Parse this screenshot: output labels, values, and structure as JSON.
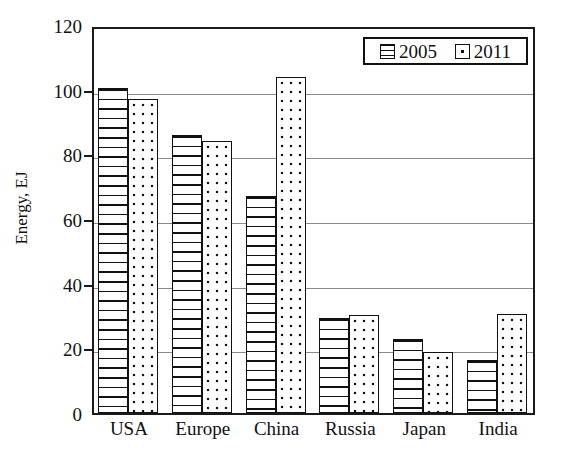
{
  "chart_data": {
    "type": "bar",
    "title": "",
    "xlabel": "",
    "ylabel": "Energy, EJ",
    "categories": [
      "USA",
      "Europe",
      "China",
      "Russia",
      "Japan",
      "India"
    ],
    "series": [
      {
        "name": "2005",
        "values": [
          100.5,
          86.0,
          67.0,
          29.5,
          23.0,
          16.5
        ],
        "pattern": "horizontal-lines"
      },
      {
        "name": "2011",
        "values": [
          97.0,
          84.0,
          104.0,
          30.3,
          19.0,
          30.5
        ],
        "pattern": "dots"
      }
    ],
    "ylim": [
      0,
      120
    ],
    "yticks": [
      0,
      20,
      40,
      60,
      80,
      100,
      120
    ],
    "ytick_labels": [
      "0",
      "20",
      "40",
      "60",
      "80",
      "100",
      "120"
    ],
    "gridlines": true,
    "grid_axis": "y",
    "legend_position": "top-right",
    "legend_entries": [
      "2005",
      "2011"
    ],
    "colors": {
      "axis": "#111111",
      "grid": "#8a8a8a",
      "bar_fill": "#ffffff",
      "bar_edge": "#111111",
      "background": "#ffffff"
    }
  }
}
